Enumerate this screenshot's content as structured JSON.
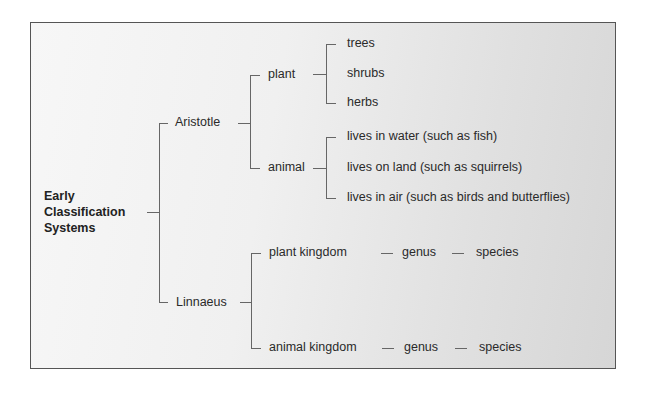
{
  "diagram": {
    "root": {
      "lines": [
        "Early",
        "Classification",
        "Systems"
      ]
    },
    "branches": [
      {
        "label": "Aristotle",
        "children": [
          {
            "label": "plant",
            "children": [
              "trees",
              "shrubs",
              "herbs"
            ]
          },
          {
            "label": "animal",
            "children": [
              "lives in water (such as fish)",
              "lives on land (such as squirrels)",
              "lives in air (such as birds and butterflies)"
            ]
          }
        ]
      },
      {
        "label": "Linnaeus",
        "children": [
          {
            "label": "plant kingdom",
            "chain": [
              "genus",
              "species"
            ]
          },
          {
            "label": "animal kingdom",
            "chain": [
              "genus",
              "species"
            ]
          }
        ]
      }
    ]
  }
}
